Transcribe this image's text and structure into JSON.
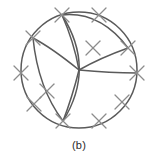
{
  "figure": {
    "caption": "(b)",
    "type": "planar-graph-drawing",
    "colors": {
      "background": "#ffffff",
      "stroke": "#5a5a5a",
      "cross_stroke": "#8c8c8c",
      "caption": "#2b2b2b"
    },
    "geometry": {
      "circle": {
        "cx": 79,
        "cy": 70,
        "r": 58
      },
      "stroke_width": 1.4,
      "cross_arm_length": 9
    },
    "vertices": [
      {
        "name": "center",
        "x": 79,
        "y": 70
      },
      {
        "name": "top",
        "x": 62,
        "y": 15
      },
      {
        "name": "upper-right",
        "x": 128,
        "y": 48
      },
      {
        "name": "bottom",
        "x": 63,
        "y": 121
      },
      {
        "name": "upper-left",
        "x": 33,
        "y": 38
      }
    ],
    "crosses": [
      {
        "id": "cross-1",
        "x": 62,
        "y": 15,
        "angle": 0
      },
      {
        "id": "cross-2",
        "x": 99,
        "y": 15,
        "angle": 0
      },
      {
        "id": "cross-3",
        "x": 128,
        "y": 48,
        "angle": 0
      },
      {
        "id": "cross-4",
        "x": 137,
        "y": 73,
        "angle": 0
      },
      {
        "id": "cross-5",
        "x": 122,
        "y": 102,
        "angle": 0
      },
      {
        "id": "cross-6",
        "x": 99,
        "y": 121,
        "angle": 0
      },
      {
        "id": "cross-7",
        "x": 63,
        "y": 121,
        "angle": 0
      },
      {
        "id": "cross-8",
        "x": 34,
        "y": 104,
        "angle": 0
      },
      {
        "id": "cross-9",
        "x": 21,
        "y": 73,
        "angle": 0
      },
      {
        "id": "cross-10",
        "x": 33,
        "y": 38,
        "angle": 0
      },
      {
        "id": "cross-11",
        "x": 93,
        "y": 48,
        "angle": 0
      },
      {
        "id": "cross-12",
        "x": 47,
        "y": 91,
        "angle": 0
      }
    ],
    "edges": [
      {
        "id": "edge-outer-circle",
        "kind": "circle"
      },
      {
        "id": "edge-top-chord",
        "kind": "curve",
        "from": "top",
        "to": "upper-right"
      },
      {
        "id": "edge-left-arc",
        "kind": "curve",
        "from": "upper-left",
        "to": "center"
      },
      {
        "id": "edge-center-right",
        "kind": "curve",
        "from": "center",
        "to": "upper-right"
      },
      {
        "id": "edge-center-east",
        "kind": "curve",
        "from": "center",
        "to": "east"
      },
      {
        "id": "edge-top-center",
        "kind": "curve",
        "from": "top",
        "to": "center"
      },
      {
        "id": "edge-top-bottom",
        "kind": "curve",
        "from": "top",
        "to": "bottom"
      },
      {
        "id": "edge-center-bottom",
        "kind": "curve",
        "from": "center",
        "to": "bottom"
      },
      {
        "id": "edge-upperleft-bottom",
        "kind": "curve",
        "from": "upper-left",
        "to": "bottom"
      }
    ]
  }
}
